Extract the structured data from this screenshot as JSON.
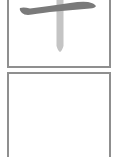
{
  "card": {
    "character": "十",
    "strokes": [
      {
        "index": 1,
        "name": "horizontal",
        "state": "completed",
        "color": "#7a7a7a"
      },
      {
        "index": 2,
        "name": "vertical",
        "state": "hint",
        "color": "#c4c4c4"
      }
    ],
    "border_color": "#8f8f8f"
  },
  "writing_area": {
    "state": "empty"
  }
}
